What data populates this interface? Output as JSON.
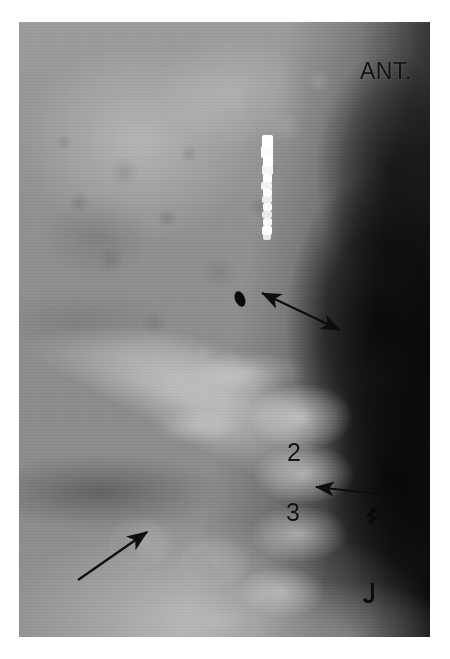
{
  "figure": {
    "modality": "radiograph",
    "view_label": "ANT.",
    "plate": {
      "left": 19,
      "top": 22,
      "width": 411,
      "height": 615,
      "background_color": "#8d8d8d",
      "border_color": "#ffffff"
    }
  },
  "labels": {
    "orientation": "ANT.",
    "vertebra_2": "2",
    "vertebra_3": "3"
  },
  "annotations": [
    {
      "name": "double-headed-arrow",
      "type": "double-arrow",
      "x1": 262,
      "y1": 293,
      "x2": 340,
      "y2": 330,
      "color": "#0d0d0d"
    },
    {
      "name": "left-pointing-arrow",
      "type": "single-arrow",
      "x1": 415,
      "y1": 498,
      "x2": 313,
      "y2": 486,
      "color": "#0d0d0d"
    },
    {
      "name": "upward-right-arrow",
      "type": "single-arrow",
      "x1": 78,
      "y1": 580,
      "x2": 150,
      "y2": 530,
      "color": "#0d0d0d"
    }
  ],
  "markers": [
    {
      "name": "dark-oval-opacity",
      "cx": 240,
      "cy": 299,
      "rx": 5,
      "ry": 8,
      "rotation": -22,
      "color": "#0a0a0a"
    },
    {
      "name": "hook-marker-upper",
      "x": 372,
      "y": 518,
      "color": "#090909"
    },
    {
      "name": "hook-marker-lower",
      "x": 366,
      "y": 592,
      "color": "#090909"
    }
  ],
  "contrast_column": {
    "name": "radiopaque-contrast-column",
    "left": 255,
    "top": 133,
    "width": 24,
    "height": 108,
    "color": "#ffffff",
    "segments": [
      {
        "x": 7,
        "y": 2,
        "w": 11,
        "h": 13,
        "o": 1.0
      },
      {
        "x": 6,
        "y": 13,
        "w": 12,
        "h": 12,
        "o": 0.96
      },
      {
        "x": 8,
        "y": 23,
        "w": 10,
        "h": 11,
        "o": 1.0
      },
      {
        "x": 7,
        "y": 32,
        "w": 11,
        "h": 10,
        "o": 0.92
      },
      {
        "x": 8,
        "y": 41,
        "w": 9,
        "h": 9,
        "o": 1.0
      },
      {
        "x": 6,
        "y": 49,
        "w": 11,
        "h": 8,
        "o": 0.88
      },
      {
        "x": 8,
        "y": 56,
        "w": 9,
        "h": 8,
        "o": 0.97
      },
      {
        "x": 7,
        "y": 63,
        "w": 10,
        "h": 7,
        "o": 0.84
      },
      {
        "x": 8,
        "y": 70,
        "w": 9,
        "h": 8,
        "o": 0.95
      },
      {
        "x": 7,
        "y": 78,
        "w": 10,
        "h": 7,
        "o": 0.82
      },
      {
        "x": 8,
        "y": 85,
        "w": 9,
        "h": 8,
        "o": 0.93
      },
      {
        "x": 7,
        "y": 93,
        "w": 10,
        "h": 9,
        "o": 0.99
      },
      {
        "x": 8,
        "y": 101,
        "w": 8,
        "h": 6,
        "o": 0.8
      }
    ]
  }
}
